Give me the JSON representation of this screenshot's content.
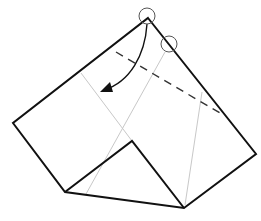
{
  "diagram": {
    "colors": {
      "outline": "#111111",
      "crease": "#c8c8c8",
      "dashed_fold": "#333333",
      "arrow": "#111111",
      "marker_circle": "#555555"
    },
    "outline_points": "148,18 256,154 184,208 65,192 13,123",
    "inner_flap_points": "65,192 132,141 184,208",
    "crease_lines": [
      {
        "x1": 81,
        "y1": 73,
        "x2": 132,
        "y2": 141
      },
      {
        "x1": 165,
        "y1": 52,
        "x2": 86,
        "y2": 194
      },
      {
        "x1": 202,
        "y1": 92,
        "x2": 185,
        "y2": 205
      }
    ],
    "valley_fold_line": {
      "x1": 116,
      "y1": 52,
      "x2": 220,
      "y2": 113
    },
    "fold_arrow": {
      "path": "M147,24 C145,55 130,82 104,90",
      "head": "100,92 110,82 113,92"
    },
    "marker_circles": [
      {
        "cx": 147,
        "cy": 16,
        "r": 8
      },
      {
        "cx": 169,
        "cy": 44,
        "r": 8
      }
    ]
  }
}
